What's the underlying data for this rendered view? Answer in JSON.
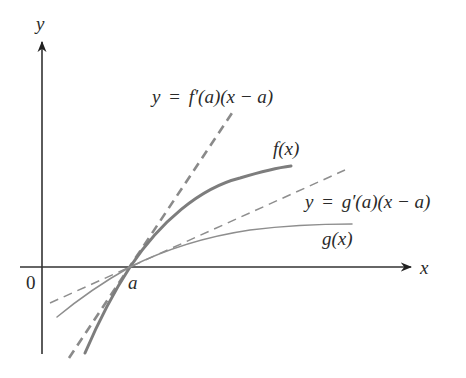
{
  "diagram": {
    "type": "tangent-lines-comparison",
    "axes": {
      "x_label": "x",
      "y_label": "y",
      "origin_label": "0",
      "point_label": "a"
    },
    "curves": [
      {
        "id": "f",
        "label": "f(x)",
        "style": "solid-thick",
        "color": "#7d7d7d"
      },
      {
        "id": "g",
        "label": "g(x)",
        "style": "solid-thin",
        "color": "#8e8e8e"
      }
    ],
    "tangent_lines": [
      {
        "id": "f-tangent",
        "label_y": "y",
        "label_eq": "=",
        "label_rhs": "f′(a)(x − a)",
        "style": "dashed-thick"
      },
      {
        "id": "g-tangent",
        "label_y": "y",
        "label_eq": "=",
        "label_rhs": "g′(a)(x − a)",
        "style": "dashed-thin"
      }
    ]
  }
}
